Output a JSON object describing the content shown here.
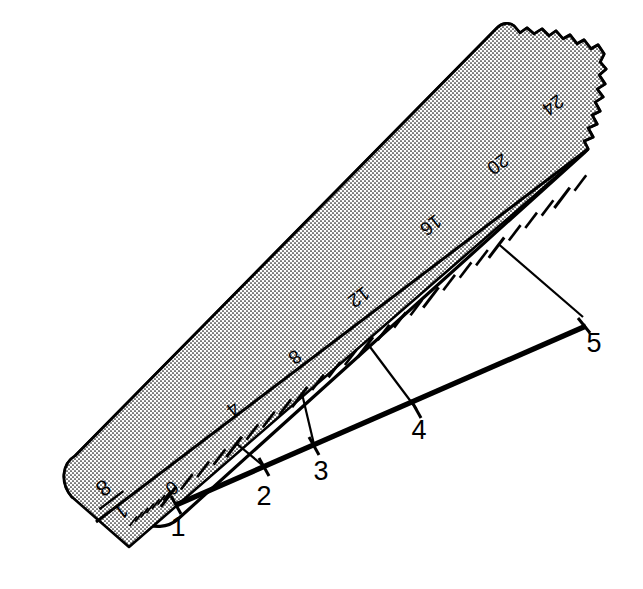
{
  "figure": {
    "background_color": "#ffffff",
    "ink_color": "#000000"
  },
  "ruler": {
    "name": "scale-rule",
    "fraction_label": {
      "numerator": "1",
      "denominator": "8",
      "display": "1/8"
    },
    "torn_end": true,
    "rounded_end": true,
    "stipple_band": "upper-half",
    "scale_numbers": [
      {
        "label": "0",
        "value": 0,
        "rotated": true
      },
      {
        "label": "4",
        "value": 4,
        "rotated": true
      },
      {
        "label": "8",
        "value": 8,
        "rotated": true
      },
      {
        "label": "12",
        "value": 12,
        "rotated": true
      },
      {
        "label": "16",
        "value": 16,
        "rotated": true
      },
      {
        "label": "20",
        "value": 20,
        "rotated": true
      },
      {
        "label": "24",
        "value": 24,
        "rotated": true
      }
    ],
    "tick_interval": 1,
    "major_tick_interval": 4,
    "fine_ticks_before_zero": 8,
    "scale_min": 0,
    "scale_max": 25
  },
  "construction_line": {
    "name": "line-to-divide",
    "divisions": 4,
    "points": [
      {
        "label": "1",
        "scale_value": 0
      },
      {
        "label": "2",
        "scale_value": 4
      },
      {
        "label": "3",
        "scale_value": 8
      },
      {
        "label": "4",
        "scale_value": 12
      },
      {
        "label": "5",
        "scale_value": 20
      }
    ],
    "projection_lines": 4
  }
}
